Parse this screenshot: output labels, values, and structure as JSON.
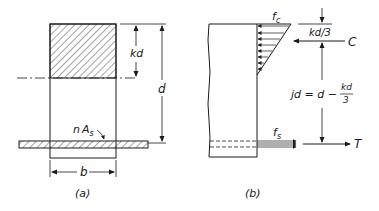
{
  "figure": {
    "panel_a": {
      "caption": "(a)",
      "labels": {
        "kd": "kd",
        "d": "d",
        "nAs_n": "n",
        "nAs_A": "A",
        "nAs_sub": "s",
        "b": "b"
      }
    },
    "panel_b": {
      "caption": "(b)",
      "labels": {
        "fc_f": "f",
        "fc_sub": "c",
        "kd3": "kd/3",
        "C": "C",
        "jd_lhs": "jd = d −",
        "jd_num": "kd",
        "jd_den": "3",
        "fs_f": "f",
        "fs_sub": "s",
        "T": "T"
      }
    },
    "colors": {
      "ink": "#1a1a1a",
      "background": "#ffffff"
    }
  }
}
